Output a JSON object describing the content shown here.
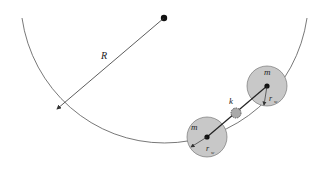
{
  "labels": {
    "radius": "R",
    "mass_upper": "m",
    "mass_lower": "m",
    "spring": "k",
    "wheel_radius_upper": "r",
    "wheel_radius_upper_sub": "w",
    "wheel_radius_lower": "r",
    "wheel_radius_lower_sub": "w"
  },
  "colors": {
    "wheel_fill": "#c8c8c8",
    "line": "#333333"
  }
}
